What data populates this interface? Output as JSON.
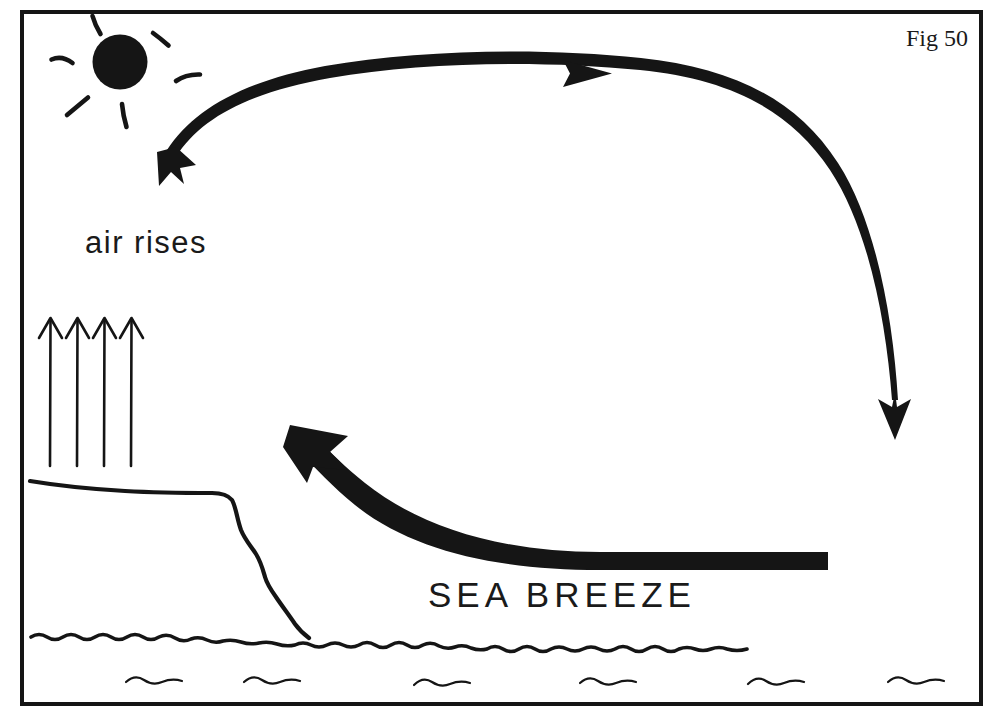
{
  "figure": {
    "id_label": "Fig 50",
    "title": "Sea Breeze",
    "background_color": "#ffffff",
    "ink_color": "#151515",
    "frame": {
      "x": 20,
      "y": 10,
      "width": 963,
      "height": 696,
      "stroke_width": 4
    }
  },
  "labels": {
    "air_rises": "air rises",
    "sea_breeze": "SEA BREEZE",
    "fig_number": "Fig 50"
  },
  "diagram": {
    "type": "meteorological-schematic",
    "elements": [
      {
        "name": "sun",
        "kind": "filled-circle-with-rays",
        "cx": 120,
        "cy": 62,
        "r": 27,
        "ray_count": 6
      },
      {
        "name": "upper-circulation-arrow",
        "kind": "curved-arrow",
        "direction": "clockwise-aloft",
        "from": [
          175,
          165
        ],
        "to": [
          895,
          437
        ]
      },
      {
        "name": "mid-arrowhead",
        "kind": "triangle",
        "points_to": "right",
        "at": [
          600,
          73
        ]
      },
      {
        "name": "rising-air-arrows",
        "kind": "thin-up-arrows",
        "count": 4,
        "x_positions": [
          50,
          77,
          103,
          130
        ],
        "y_top": 318,
        "y_bottom": 466
      },
      {
        "name": "sea-breeze-arrow",
        "kind": "thick-tapered-curved-arrow",
        "direction": "right-to-left-onshore",
        "from": [
          828,
          565
        ],
        "to": [
          292,
          428
        ]
      },
      {
        "name": "land-profile",
        "kind": "freehand-line",
        "description": "flat plateau with steep cliff to shore"
      },
      {
        "name": "sea-surface",
        "kind": "wavy-line",
        "y": 640
      },
      {
        "name": "sea-waves",
        "kind": "small-squiggles",
        "count": 6,
        "y": 681
      }
    ]
  }
}
